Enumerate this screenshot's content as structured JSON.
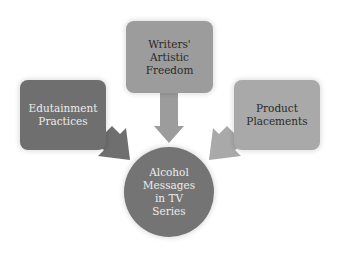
{
  "diagram": {
    "title": "",
    "center": {
      "label": "Alcohol\nMessages\nin TV\nSeries",
      "color": "#747474"
    },
    "nodes": [
      {
        "id": "left",
        "label": "Edutainment\nPractices",
        "color": "#6f6f6f",
        "text_color": "#ececec"
      },
      {
        "id": "top",
        "label": "Writers'\nArtistic\nFreedom",
        "color": "#9c9c9c",
        "text_color": "#2a2a2a"
      },
      {
        "id": "right",
        "label": "Product\nPlacements",
        "color": "#a9a9a9",
        "text_color": "#2a2a2a"
      }
    ],
    "edges": [
      {
        "from": "left",
        "to": "center",
        "color": "#6f6f6f"
      },
      {
        "from": "top",
        "to": "center",
        "color": "#9c9c9c"
      },
      {
        "from": "right",
        "to": "center",
        "color": "#a9a9a9"
      }
    ]
  }
}
